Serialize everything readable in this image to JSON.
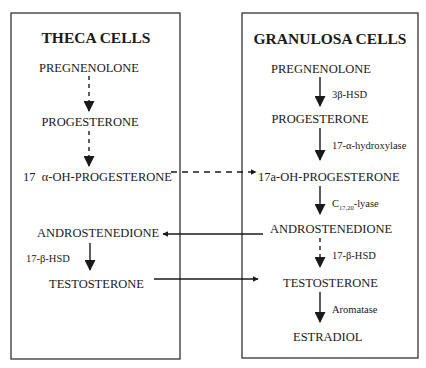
{
  "diagram": {
    "theca": {
      "title": "THECA CELLS",
      "compounds": [
        "PREGNENOLONE",
        "PROGESTERONE",
        "17  α-OH-PROGESTERONE",
        "ANDROSTENEDIONE",
        "TESTOSTERONE"
      ],
      "enzymes": [
        "17-β-HSD"
      ],
      "steps": [
        {
          "from": "PREGNENOLONE",
          "to": "PROGESTERONE",
          "style": "dashed"
        },
        {
          "from": "PROGESTERONE",
          "to": "17  α-OH-PROGESTERONE",
          "style": "dashed"
        },
        {
          "from": "ANDROSTENEDIONE",
          "to": "TESTOSTERONE",
          "style": "solid",
          "enzyme": "17-β-HSD"
        }
      ]
    },
    "granulosa": {
      "title": "GRANULOSA CELLS",
      "compounds": [
        "PREGNENOLONE",
        "PROGESTERONE",
        "17a-OH-PROGESTERONE",
        "ANDROSTENEDIONE",
        "TESTOSTERONE",
        "ESTRADIOL"
      ],
      "enzymes": {
        "e1": "3β-HSD",
        "e2": "17-α-hydroxylase",
        "e3_main": "C",
        "e3_sub": "17,20",
        "e3_suffix": "-lyase",
        "e4": "17-β-HSD",
        "e5": "Aromatase"
      },
      "steps": [
        {
          "from": "PREGNENOLONE",
          "to": "PROGESTERONE",
          "style": "solid",
          "enzyme": "3β-HSD"
        },
        {
          "from": "PROGESTERONE",
          "to": "17a-OH-PROGESTERONE",
          "style": "solid",
          "enzyme": "17-α-hydroxylase"
        },
        {
          "from": "17a-OH-PROGESTERONE",
          "to": "ANDROSTENEDIONE",
          "style": "solid",
          "enzyme": "C17,20-lyase"
        },
        {
          "from": "ANDROSTENEDIONE",
          "to": "TESTOSTERONE",
          "style": "dashed",
          "enzyme": "17-β-HSD"
        },
        {
          "from": "TESTOSTERONE",
          "to": "ESTRADIOL",
          "style": "solid",
          "enzyme": "Aromatase"
        }
      ]
    },
    "cross_links": [
      {
        "from": "theca.17 α-OH-PROGESTERONE",
        "to": "granulosa.17a-OH-PROGESTERONE",
        "style": "dashed"
      },
      {
        "from": "granulosa.ANDROSTENEDIONE",
        "to": "theca.ANDROSTENEDIONE",
        "style": "solid"
      },
      {
        "from": "theca.TESTOSTERONE",
        "to": "granulosa.TESTOSTERONE",
        "style": "solid"
      }
    ]
  }
}
